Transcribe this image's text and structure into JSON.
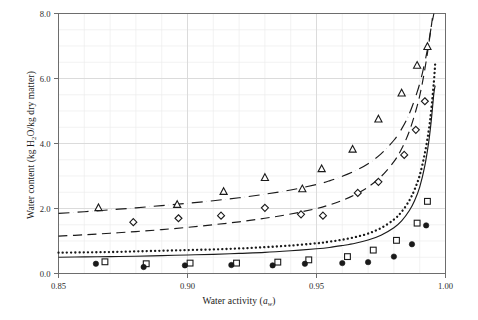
{
  "chart_data": {
    "type": "scatter",
    "title": "",
    "xlabel": "Water activity (aw)",
    "xlabel_main": "Water activity (",
    "xlabel_sym": "a",
    "xlabel_sub": "w",
    "xlabel_end": ")",
    "ylabel": "Water content (kg H2O/kg dry matter)",
    "ylabel_pre": "Water content (kg H",
    "ylabel_sub": "2",
    "ylabel_post": "O/kg dry matter)",
    "xlim": [
      0.85,
      1.0
    ],
    "ylim": [
      0.0,
      8.0
    ],
    "xticks": [
      "0.85",
      "0.90",
      "0.95",
      "1.00"
    ],
    "xtick_values": [
      0.85,
      0.9,
      0.95,
      1.0
    ],
    "yticks": [
      "0.0",
      "2.0",
      "4.0",
      "6.0",
      "8.0"
    ],
    "ytick_values": [
      0.0,
      2.0,
      4.0,
      6.0,
      8.0
    ],
    "grid": true,
    "grid_minor_x_step": 0.01,
    "grid_minor_y_step": 0.5,
    "legend": "none",
    "series": [
      {
        "name": "triangle-markers",
        "marker": "open-triangle",
        "style": "markers",
        "color": "#1a1a1a",
        "points": [
          [
            0.8655,
            2.02
          ],
          [
            0.896,
            2.12
          ],
          [
            0.914,
            2.52
          ],
          [
            0.93,
            2.95
          ],
          [
            0.9445,
            2.6
          ],
          [
            0.952,
            3.22
          ],
          [
            0.964,
            3.82
          ],
          [
            0.974,
            4.75
          ],
          [
            0.983,
            5.55
          ],
          [
            0.989,
            6.4
          ],
          [
            0.993,
            6.98
          ]
        ]
      },
      {
        "name": "diamond-markers",
        "marker": "open-diamond",
        "style": "markers",
        "color": "#1a1a1a",
        "points": [
          [
            0.879,
            1.58
          ],
          [
            0.8965,
            1.7
          ],
          [
            0.913,
            1.78
          ],
          [
            0.93,
            2.02
          ],
          [
            0.944,
            1.82
          ],
          [
            0.9525,
            1.78
          ],
          [
            0.966,
            2.48
          ],
          [
            0.974,
            2.82
          ],
          [
            0.984,
            3.65
          ],
          [
            0.9885,
            4.42
          ],
          [
            0.992,
            5.3
          ]
        ]
      },
      {
        "name": "square-markers",
        "marker": "open-square",
        "style": "markers",
        "color": "#1a1a1a",
        "points": [
          [
            0.868,
            0.36
          ],
          [
            0.884,
            0.3
          ],
          [
            0.901,
            0.32
          ],
          [
            0.919,
            0.32
          ],
          [
            0.935,
            0.35
          ],
          [
            0.947,
            0.42
          ],
          [
            0.962,
            0.52
          ],
          [
            0.972,
            0.72
          ],
          [
            0.981,
            1.02
          ],
          [
            0.989,
            1.55
          ],
          [
            0.993,
            2.22
          ]
        ]
      },
      {
        "name": "filled-circle-markers",
        "marker": "filled-circle",
        "style": "markers",
        "color": "#1a1a1a",
        "points": [
          [
            0.8645,
            0.3
          ],
          [
            0.883,
            0.2
          ],
          [
            0.899,
            0.25
          ],
          [
            0.917,
            0.26
          ],
          [
            0.933,
            0.25
          ],
          [
            0.9455,
            0.3
          ],
          [
            0.96,
            0.32
          ],
          [
            0.97,
            0.35
          ],
          [
            0.98,
            0.52
          ],
          [
            0.987,
            0.9
          ],
          [
            0.9925,
            1.48
          ]
        ]
      }
    ],
    "curves": [
      {
        "name": "dash-dot-curve",
        "style": "dash-dot",
        "color": "#1a1a1a",
        "points": [
          [
            0.85,
            1.85
          ],
          [
            0.86,
            1.9
          ],
          [
            0.87,
            1.96
          ],
          [
            0.88,
            2.02
          ],
          [
            0.89,
            2.09
          ],
          [
            0.9,
            2.16
          ],
          [
            0.91,
            2.24
          ],
          [
            0.92,
            2.33
          ],
          [
            0.93,
            2.44
          ],
          [
            0.94,
            2.57
          ],
          [
            0.95,
            2.74
          ],
          [
            0.955,
            2.85
          ],
          [
            0.96,
            2.99
          ],
          [
            0.965,
            3.16
          ],
          [
            0.97,
            3.38
          ],
          [
            0.975,
            3.68
          ],
          [
            0.98,
            4.1
          ],
          [
            0.983,
            4.45
          ],
          [
            0.986,
            4.92
          ],
          [
            0.989,
            5.58
          ],
          [
            0.991,
            6.15
          ],
          [
            0.993,
            6.9
          ],
          [
            0.9945,
            7.6
          ],
          [
            0.9955,
            8.0
          ]
        ]
      },
      {
        "name": "dashed-curve",
        "style": "dashed",
        "color": "#1a1a1a",
        "points": [
          [
            0.85,
            1.15
          ],
          [
            0.86,
            1.19
          ],
          [
            0.87,
            1.24
          ],
          [
            0.88,
            1.29
          ],
          [
            0.89,
            1.35
          ],
          [
            0.9,
            1.42
          ],
          [
            0.91,
            1.5
          ],
          [
            0.92,
            1.59
          ],
          [
            0.93,
            1.7
          ],
          [
            0.94,
            1.83
          ],
          [
            0.95,
            2.0
          ],
          [
            0.955,
            2.11
          ],
          [
            0.96,
            2.25
          ],
          [
            0.965,
            2.43
          ],
          [
            0.97,
            2.66
          ],
          [
            0.975,
            2.98
          ],
          [
            0.98,
            3.44
          ],
          [
            0.983,
            3.84
          ],
          [
            0.986,
            4.38
          ],
          [
            0.989,
            5.15
          ],
          [
            0.991,
            5.85
          ],
          [
            0.993,
            6.78
          ],
          [
            0.995,
            7.9
          ]
        ]
      },
      {
        "name": "dotted-curve",
        "style": "dotted",
        "color": "#1a1a1a",
        "points": [
          [
            0.85,
            0.64
          ],
          [
            0.86,
            0.65
          ],
          [
            0.87,
            0.66
          ],
          [
            0.88,
            0.68
          ],
          [
            0.89,
            0.7
          ],
          [
            0.9,
            0.72
          ],
          [
            0.91,
            0.74
          ],
          [
            0.92,
            0.77
          ],
          [
            0.93,
            0.81
          ],
          [
            0.94,
            0.86
          ],
          [
            0.95,
            0.93
          ],
          [
            0.955,
            0.98
          ],
          [
            0.96,
            1.04
          ],
          [
            0.965,
            1.12
          ],
          [
            0.97,
            1.23
          ],
          [
            0.975,
            1.4
          ],
          [
            0.98,
            1.66
          ],
          [
            0.983,
            1.9
          ],
          [
            0.986,
            2.25
          ],
          [
            0.988,
            2.58
          ],
          [
            0.99,
            3.02
          ],
          [
            0.992,
            3.7
          ],
          [
            0.9935,
            4.4
          ],
          [
            0.9945,
            5.05
          ],
          [
            0.9955,
            5.9
          ],
          [
            0.996,
            6.45
          ]
        ]
      },
      {
        "name": "solid-curve",
        "style": "solid",
        "color": "#1a1a1a",
        "points": [
          [
            0.85,
            0.5
          ],
          [
            0.86,
            0.51
          ],
          [
            0.87,
            0.52
          ],
          [
            0.88,
            0.53
          ],
          [
            0.89,
            0.55
          ],
          [
            0.9,
            0.57
          ],
          [
            0.91,
            0.59
          ],
          [
            0.92,
            0.62
          ],
          [
            0.93,
            0.65
          ],
          [
            0.94,
            0.7
          ],
          [
            0.95,
            0.76
          ],
          [
            0.955,
            0.8
          ],
          [
            0.96,
            0.86
          ],
          [
            0.965,
            0.93
          ],
          [
            0.97,
            1.03
          ],
          [
            0.975,
            1.18
          ],
          [
            0.98,
            1.41
          ],
          [
            0.983,
            1.62
          ],
          [
            0.986,
            1.94
          ],
          [
            0.988,
            2.24
          ],
          [
            0.99,
            2.66
          ],
          [
            0.992,
            3.32
          ],
          [
            0.9935,
            4.05
          ],
          [
            0.9945,
            4.72
          ],
          [
            0.9955,
            5.55
          ],
          [
            0.996,
            5.78
          ]
        ]
      }
    ]
  },
  "style": {
    "axis_color": "#6d6d6d",
    "grid_major_color": "#d8d8d8",
    "grid_minor_color": "#ededed",
    "ink": "#1a1a1a",
    "background": "#ffffff"
  }
}
